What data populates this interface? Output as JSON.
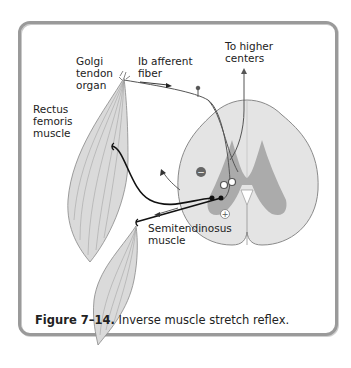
{
  "figure": {
    "labels": {
      "golgi": [
        "Golgi",
        "tendon",
        "organ"
      ],
      "ib_fiber": [
        "Ib afferent",
        "fiber"
      ],
      "higher": [
        "To higher",
        "centers"
      ],
      "rectus": [
        "Rectus",
        "femoris",
        "muscle"
      ],
      "semi": [
        "Semitendinosus",
        "muscle"
      ]
    },
    "symbols": {
      "inhibitory": "−",
      "excitatory": "+"
    },
    "caption": {
      "number": "Figure 7–14.",
      "text": "Inverse muscle stretch reflex."
    },
    "colors": {
      "muscle": "#d9d9d9",
      "cord_white": "#e6e6e6",
      "cord_gray": "#a8a8a8",
      "line": "#1a1a1a",
      "frame": "#9a9a9a"
    }
  }
}
